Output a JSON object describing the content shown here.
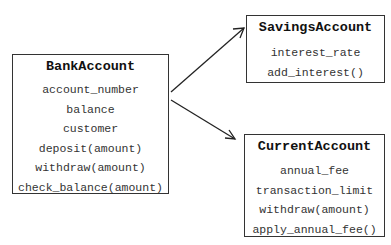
{
  "diagram": {
    "type": "class-inheritance",
    "classes": [
      {
        "name": "BankAccount",
        "members": [
          "account_number",
          "balance",
          "customer",
          "deposit(amount)",
          "withdraw(amount)",
          "check_balance(amount)"
        ]
      },
      {
        "name": "SavingsAccount",
        "members": [
          "interest_rate",
          "add_interest()"
        ]
      },
      {
        "name": "CurrentAccount",
        "members": [
          "annual_fee",
          "transaction_limit",
          "withdraw(amount)",
          "apply_annual_fee()"
        ]
      }
    ],
    "edges": [
      {
        "from": "BankAccount",
        "to": "SavingsAccount"
      },
      {
        "from": "BankAccount",
        "to": "CurrentAccount"
      }
    ]
  }
}
